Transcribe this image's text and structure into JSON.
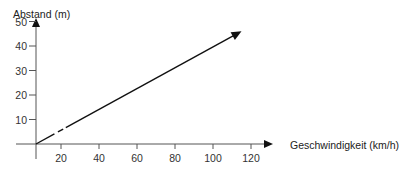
{
  "chart_data": {
    "type": "line",
    "title": "",
    "xlabel": "Geschwindigkeit (km/h)",
    "ylabel": "Abstand (m)",
    "x_ticks": [
      20,
      40,
      60,
      80,
      100,
      120
    ],
    "y_ticks": [
      10,
      20,
      30,
      40,
      50
    ],
    "xlim": [
      0,
      125
    ],
    "ylim": [
      0,
      52
    ],
    "grid": false,
    "legend": null,
    "series": [
      {
        "name": "Abstand",
        "style": "solid with short dashed gap near origin, arrow at end",
        "x": [
          0,
          100,
          115
        ],
        "y": [
          0,
          40,
          46
        ]
      }
    ],
    "colors": {
      "axis": "#555555",
      "line": "#111111",
      "text": "#222222"
    }
  }
}
